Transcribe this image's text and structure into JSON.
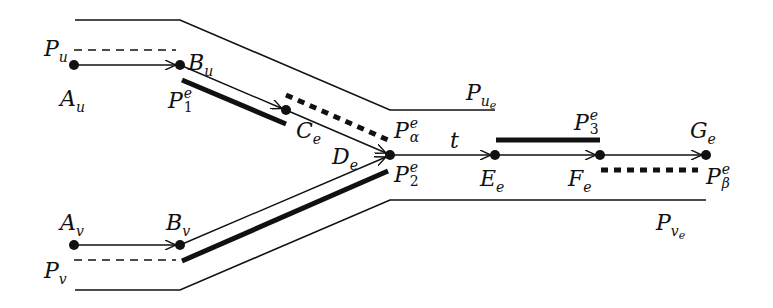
{
  "diagram": {
    "type": "path-structure",
    "colors": {
      "ink": "#111111",
      "background": "#ffffff"
    },
    "nodes": [
      {
        "id": "A_u",
        "base": "A",
        "sub": "u",
        "x": 74,
        "y": 65
      },
      {
        "id": "B_u",
        "base": "B",
        "sub": "u",
        "x": 180,
        "y": 65
      },
      {
        "id": "C_e",
        "base": "C",
        "sub": "e",
        "x": 286,
        "y": 110
      },
      {
        "id": "D_e",
        "base": "D",
        "sub": "e",
        "x": 390,
        "y": 155
      },
      {
        "id": "E_e",
        "base": "E",
        "sub": "e",
        "x": 495,
        "y": 155
      },
      {
        "id": "F_e",
        "base": "F",
        "sub": "e",
        "x": 600,
        "y": 155
      },
      {
        "id": "G_e",
        "base": "G",
        "sub": "e",
        "x": 706,
        "y": 155
      },
      {
        "id": "A_v",
        "base": "A",
        "sub": "v",
        "x": 74,
        "y": 245
      },
      {
        "id": "B_v",
        "base": "B",
        "sub": "v",
        "x": 180,
        "y": 245
      }
    ],
    "edges": [
      {
        "from": "A_u",
        "to": "B_u",
        "arrow": true
      },
      {
        "from": "B_u",
        "to": "C_e",
        "arrow": true
      },
      {
        "from": "C_e",
        "to": "D_e",
        "arrow": true
      },
      {
        "from": "A_v",
        "to": "B_v",
        "arrow": false
      },
      {
        "from": "B_v",
        "to": "D_e",
        "arrow": true
      },
      {
        "from": "D_e",
        "to": "E_e",
        "arrow": true,
        "label": "t"
      },
      {
        "from": "E_e",
        "to": "F_e",
        "arrow": true
      },
      {
        "from": "F_e",
        "to": "G_e",
        "arrow": true
      }
    ],
    "paths": [
      {
        "name": "P_u",
        "style": "dashed-thin"
      },
      {
        "name": "P_v",
        "style": "dashed-thin"
      },
      {
        "name": "P_1^e",
        "style": "thick"
      },
      {
        "name": "P_2^e",
        "style": "thick"
      },
      {
        "name": "P_3^e",
        "style": "thick"
      },
      {
        "name": "P_alpha^e",
        "style": "dashed-thick"
      },
      {
        "name": "P_beta^e",
        "style": "dashed-thick"
      },
      {
        "name": "P_{u_e}",
        "style": "outline"
      },
      {
        "name": "P_{v_e}",
        "style": "outline"
      }
    ]
  },
  "labels": {
    "A_u": {
      "base": "A",
      "sub": "u"
    },
    "B_u": {
      "base": "B",
      "sub": "u"
    },
    "C_e": {
      "base": "C",
      "sub": "e"
    },
    "D_e": {
      "base": "D",
      "sub": "e"
    },
    "E_e": {
      "base": "E",
      "sub": "e"
    },
    "F_e": {
      "base": "F",
      "sub": "e"
    },
    "G_e": {
      "base": "G",
      "sub": "e"
    },
    "A_v": {
      "base": "A",
      "sub": "v"
    },
    "B_v": {
      "base": "B",
      "sub": "v"
    },
    "P_u": {
      "base": "P",
      "sub": "u"
    },
    "P_v": {
      "base": "P",
      "sub": "v"
    },
    "P_1e": {
      "base": "P",
      "sup": "e",
      "sub": "1"
    },
    "P_2e": {
      "base": "P",
      "sup": "e",
      "sub": "2"
    },
    "P_3e": {
      "base": "P",
      "sup": "e",
      "sub": "3"
    },
    "P_alpha": {
      "base": "P",
      "sup": "e",
      "sub": "α"
    },
    "P_beta": {
      "base": "P",
      "sup": "e",
      "sub": "β"
    },
    "P_ue": {
      "base": "P",
      "sub": "u",
      "subsub": "e"
    },
    "P_ve": {
      "base": "P",
      "sub": "v",
      "subsub": "e"
    },
    "t": {
      "text": "t"
    }
  }
}
